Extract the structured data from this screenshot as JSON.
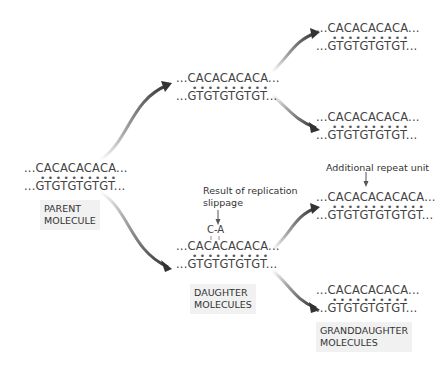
{
  "parent": {
    "top": "...CACACACACA...",
    "bottom": "...GTGTGTGTGT...",
    "label": "PARENT\nMOLECULE"
  },
  "daughters": {
    "label": "DAUGHTER\nMOLECULES",
    "d1": {
      "top": "...CACACACACA...",
      "bottom": "...GTGTGTGTGT..."
    },
    "d2": {
      "top": "...CACACACACA...",
      "bottom": "...GTGTGTGTGT...",
      "bulge": "C-A",
      "note": "Result of replication\nslippage"
    }
  },
  "granddaughters": {
    "label": "GRANDDAUGHTER\nMOLECULES",
    "g1": {
      "top": "...CACACACACA...",
      "bottom": "...GTGTGTGTGT..."
    },
    "g2": {
      "top": "...CACACACACA...",
      "bottom": "...GTGTGTGTGT..."
    },
    "g3": {
      "top": "...CACACACACACA...",
      "bottom": "...GTGTGTGTGTGT...",
      "note": "Additional repeat unit"
    },
    "g4": {
      "top": "...CACACACACA...",
      "bottom": "...GTGTGTGTGT..."
    }
  },
  "dots": {
    "ten": "••••••••••",
    "twelve": "••••••••••••"
  }
}
